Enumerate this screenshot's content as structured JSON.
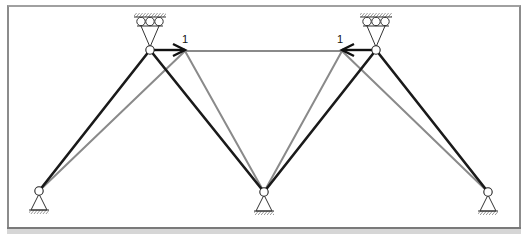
{
  "diagram": {
    "type": "truss-displacement",
    "colors": {
      "original_member": "#1a1a1a",
      "displaced_member": "#8a8a8a",
      "support": "#333333",
      "frame": "#8c8c8c",
      "band": "#d6d6d6"
    },
    "joints": {
      "bottom_left": [
        39,
        191
      ],
      "top_left": [
        150,
        50
      ],
      "bottom_center": [
        264,
        192
      ],
      "top_right": [
        376,
        50
      ],
      "bottom_right": [
        488,
        192
      ]
    },
    "displaced_joints": {
      "top_left": [
        185,
        51
      ],
      "top_right": [
        342,
        51
      ]
    },
    "original_members": [
      [
        "bottom_left",
        "top_left"
      ],
      [
        "top_left",
        "bottom_center"
      ],
      [
        "bottom_center",
        "top_right"
      ],
      [
        "top_right",
        "bottom_right"
      ]
    ],
    "displaced_members": [
      [
        "bottom_left",
        "top_left"
      ],
      [
        "top_left",
        "bottom_center"
      ],
      [
        "top_left",
        "top_right"
      ],
      [
        "bottom_center",
        "top_right"
      ],
      [
        "top_right",
        "bottom_right"
      ]
    ],
    "loads": [
      {
        "name": "load-left",
        "from": [
          150,
          50
        ],
        "to": [
          185,
          50
        ],
        "label": "1",
        "label_pos": [
          182,
          43
        ]
      },
      {
        "name": "load-right",
        "from": [
          376,
          50
        ],
        "to": [
          342,
          50
        ],
        "label": "1",
        "label_pos": [
          337,
          43
        ]
      }
    ],
    "supports": [
      {
        "type": "roller-ceiling",
        "at": "top_left"
      },
      {
        "type": "roller-ceiling",
        "at": "top_right"
      },
      {
        "type": "pin",
        "at": "bottom_left"
      },
      {
        "type": "pin",
        "at": "bottom_center"
      },
      {
        "type": "pin",
        "at": "bottom_right"
      }
    ]
  }
}
